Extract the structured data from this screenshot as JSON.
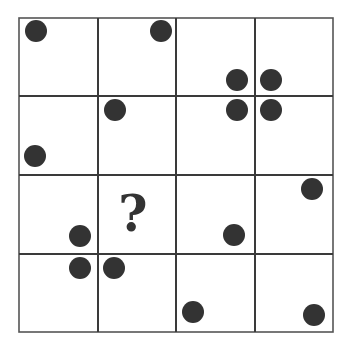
{
  "puzzle": {
    "title": "",
    "rows": 4,
    "cols": 4,
    "grid": {
      "x_lines": [
        19,
        98,
        176,
        255,
        333
      ],
      "y_lines": [
        18,
        96,
        175,
        254,
        332
      ],
      "line_color": "#3a3a3a"
    },
    "dot_color": "#333333",
    "dot_radius": 11,
    "dots": [
      {
        "x": 36,
        "y": 31
      },
      {
        "x": 161,
        "y": 31
      },
      {
        "x": 237,
        "y": 80
      },
      {
        "x": 271,
        "y": 80
      },
      {
        "x": 237,
        "y": 110
      },
      {
        "x": 271,
        "y": 110
      },
      {
        "x": 115,
        "y": 110
      },
      {
        "x": 35,
        "y": 156
      },
      {
        "x": 312,
        "y": 189
      },
      {
        "x": 80,
        "y": 236
      },
      {
        "x": 234,
        "y": 235
      },
      {
        "x": 80,
        "y": 268
      },
      {
        "x": 114,
        "y": 268
      },
      {
        "x": 193,
        "y": 312
      },
      {
        "x": 314,
        "y": 315
      }
    ],
    "unknown_cell": {
      "row": 2,
      "col": 1,
      "symbol": "?",
      "x": 133,
      "y": 214
    }
  }
}
